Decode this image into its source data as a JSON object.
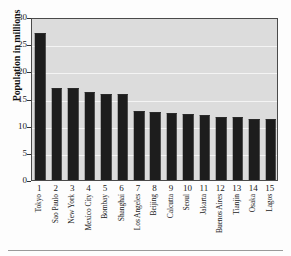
{
  "chart_data": {
    "type": "bar",
    "title": "",
    "subtitle": "",
    "xlabel": "",
    "ylabel": "Population in millions",
    "ylim": [
      0,
      30
    ],
    "ytick_labels": [
      "0",
      "5",
      "10",
      "15",
      "20",
      "25",
      "30"
    ],
    "ytick_values": [
      0,
      5,
      10,
      15,
      20,
      25,
      30
    ],
    "grid": true,
    "grid_axis": "y",
    "legend": false,
    "legend_position": "none",
    "bar_color": "#1d1d1d",
    "plot_background": "#dcdcdc",
    "gridline_color": "#f4f4f4",
    "categories": [
      "Tokyo",
      "Sao Paulo",
      "New York",
      "Mexico City",
      "Bombay",
      "Shanghai",
      "Los Angeles",
      "Beijing",
      "Calcutta",
      "Seoul",
      "Jakarta",
      "Buenos Aires",
      "Tianjin",
      "Osaka",
      "Lagos"
    ],
    "xtick_labels": [
      "1",
      "2",
      "3",
      "4",
      "5",
      "6",
      "7",
      "8",
      "9",
      "10",
      "11",
      "12",
      "13",
      "14",
      "15"
    ],
    "values": [
      26.8,
      16.8,
      16.8,
      16.0,
      15.6,
      15.6,
      12.6,
      12.4,
      12.1,
      11.9,
      11.7,
      11.5,
      11.4,
      11.1,
      11.0
    ]
  }
}
